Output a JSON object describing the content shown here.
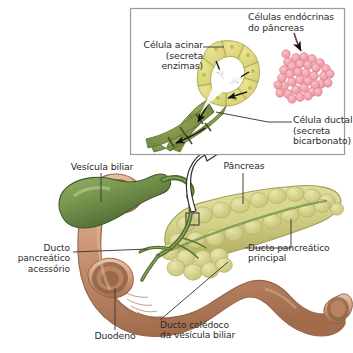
{
  "figure": {
    "language": "pt-BR",
    "background_color": "#ffffff",
    "text_color": "#2b2b2b"
  },
  "inset": {
    "name": "detalhe-acino-pancreatico",
    "border_color": "#9a9a9a",
    "background": "#ffffff",
    "labels": {
      "acinar_cell": "Célula acinar\n(secreta\nenzimas)",
      "endocrine_cells": "Células endócrinas\ndo pâncreas",
      "duct_cell": "Célula ductal\n(secreta\nbicarbonato)"
    }
  },
  "main": {
    "labels": {
      "gallbladder": "Vesícula biliar",
      "pancreas": "Pâncreas",
      "accessory_duct": "Ducto\npancreático\nacessório",
      "main_duct": "Ducto pancreático\nprincipal",
      "duodenum": "Duodeno",
      "common_bile_duct": "Ducto colédoco\nda vesícula biliar"
    }
  },
  "colors": {
    "acinar_cell_fill": "#e2dd84",
    "acinar_cell_stroke": "#a9a24e",
    "duct_cell_fill": "#7f9442",
    "duct_cell_stroke": "#5d7030",
    "islet_fill": "#f29fa8",
    "islet_stroke": "#d96f7e",
    "gallbladder_fill": "#6f8f4a",
    "gallbladder_stroke": "#4d6630",
    "duodenum_fill": "#c99274",
    "duodenum_stroke": "#9c6b4e",
    "pancreas_fill": "#d8d58a",
    "pancreas_stroke": "#a8a45c",
    "duct_green": "#5f7a3a",
    "leader_line": "#3a3a3a",
    "arrow_black": "#111111"
  }
}
